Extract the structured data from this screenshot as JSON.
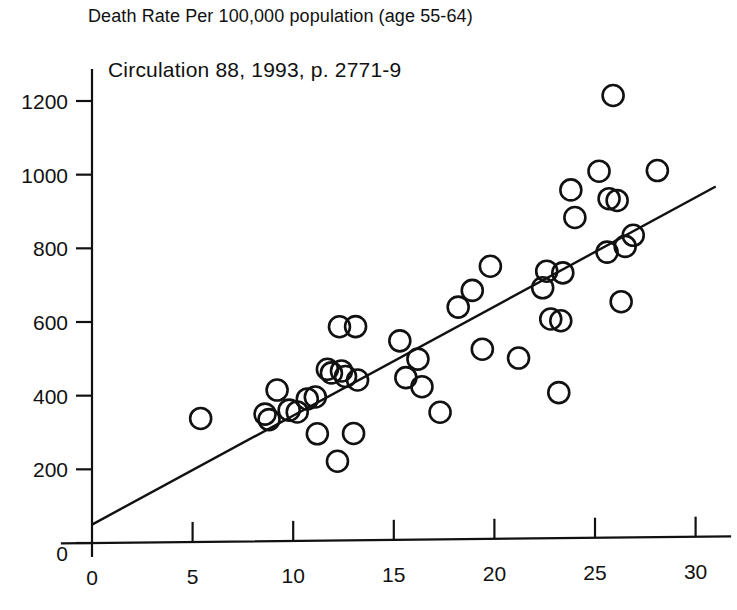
{
  "figure": {
    "title": "Death Rate Per 100,000  population (age 55-64)",
    "annotation": "Circulation 88, 1993, p. 2771-9"
  },
  "chart_data": {
    "type": "scatter",
    "title": "Death Rate Per 100,000  population (age 55-64)",
    "annotations": [
      "Circulation 88, 1993, p. 2771-9"
    ],
    "xlabel": "",
    "ylabel": "",
    "xlim": [
      0,
      31
    ],
    "ylim": [
      0,
      1270
    ],
    "grid": false,
    "legend": null,
    "xticks": [
      0,
      5,
      10,
      15,
      20,
      25,
      30
    ],
    "yticks": [
      0,
      200,
      400,
      600,
      800,
      1000,
      1200
    ],
    "xticklabels": [
      "0",
      "5",
      "10",
      "15",
      "20",
      "25",
      "30"
    ],
    "yticklabels": [
      "0",
      "200",
      "400",
      "600",
      "800",
      "1000",
      "1200"
    ],
    "marker": "open-circle",
    "points": [
      [
        5.4,
        335
      ],
      [
        8.6,
        345
      ],
      [
        8.8,
        330
      ],
      [
        9.2,
        410
      ],
      [
        9.8,
        355
      ],
      [
        10.2,
        350
      ],
      [
        10.7,
        385
      ],
      [
        11.1,
        390
      ],
      [
        11.2,
        290
      ],
      [
        11.7,
        465
      ],
      [
        11.9,
        455
      ],
      [
        12.2,
        215
      ],
      [
        12.3,
        580
      ],
      [
        12.4,
        460
      ],
      [
        12.6,
        445
      ],
      [
        13.0,
        290
      ],
      [
        13.1,
        580
      ],
      [
        13.2,
        435
      ],
      [
        15.3,
        540
      ],
      [
        15.6,
        440
      ],
      [
        16.2,
        490
      ],
      [
        16.4,
        415
      ],
      [
        17.3,
        345
      ],
      [
        18.2,
        630
      ],
      [
        18.9,
        675
      ],
      [
        19.4,
        515
      ],
      [
        19.8,
        740
      ],
      [
        21.2,
        490
      ],
      [
        22.4,
        680
      ],
      [
        22.6,
        725
      ],
      [
        22.8,
        595
      ],
      [
        23.2,
        395
      ],
      [
        23.3,
        590
      ],
      [
        23.4,
        720
      ],
      [
        23.8,
        945
      ],
      [
        24.0,
        870
      ],
      [
        25.2,
        995
      ],
      [
        25.6,
        775
      ],
      [
        25.7,
        920
      ],
      [
        25.9,
        1200
      ],
      [
        26.1,
        915
      ],
      [
        26.3,
        640
      ],
      [
        26.5,
        790
      ],
      [
        26.9,
        820
      ],
      [
        28.1,
        995
      ]
    ],
    "fit_line": {
      "label": "linear regression line",
      "x": [
        0,
        31
      ],
      "y": [
        50,
        950
      ]
    }
  }
}
